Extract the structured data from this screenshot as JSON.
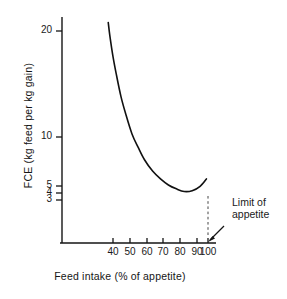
{
  "chart_data": {
    "type": "line",
    "title": "",
    "xlabel": "Feed intake (% of appetite)",
    "ylabel": "FCE (kg feed per kg gain)",
    "xlim": [
      30,
      103
    ],
    "ylim": [
      2.6,
      24
    ],
    "yscale": "log",
    "xscale": "linear",
    "grid": false,
    "legend": null,
    "xticks": [
      40,
      50,
      60,
      70,
      80,
      90,
      100
    ],
    "xtick_labels": [
      "40",
      "50",
      "60",
      "70",
      "80",
      "90",
      "100"
    ],
    "yticks": [
      20,
      10,
      5,
      4,
      3
    ],
    "ytick_labels": [
      "20",
      "10",
      "5",
      "4",
      "3"
    ],
    "series": [
      {
        "name": "FCE curve",
        "x": [
          37,
          38,
          40,
          42,
          45,
          48,
          52,
          56,
          60,
          65,
          70,
          75,
          80,
          85,
          90,
          95,
          99
        ],
        "y": [
          22.0,
          19.0,
          15.0,
          12.4,
          9.6,
          7.9,
          6.3,
          5.4,
          4.7,
          4.15,
          3.8,
          3.55,
          3.4,
          3.3,
          3.33,
          3.5,
          3.8
        ]
      }
    ],
    "annotations": [
      {
        "name": "limit-of-appetite",
        "text_lines": [
          "Limit of",
          "appetite"
        ],
        "x": 100,
        "style": "dashed vertical line at x=100 with arrow pointing to axis"
      }
    ]
  },
  "axis": {
    "x_title": "Feed intake (% of appetite)",
    "y_title": "FCE (kg feed per kg gain)",
    "x_labels": [
      "40",
      "50",
      "60",
      "70",
      "80",
      "90",
      "100"
    ],
    "y_labels": {
      "v20": "20",
      "v10": "10",
      "v5": "5",
      "v4": "4",
      "v3": "3"
    }
  },
  "annotation": {
    "line1": "Limit of",
    "line2": "appetite"
  },
  "colors": {
    "background": "#ffffff",
    "ink": "#151515",
    "curve": "#111111",
    "dashed": "#444444"
  }
}
